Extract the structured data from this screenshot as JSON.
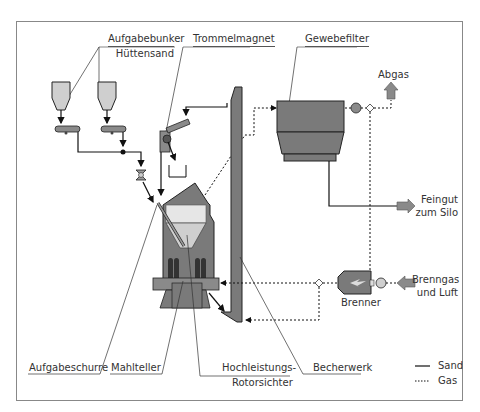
{
  "colors": {
    "frame": "#777777",
    "equipment_dark": "#7a7a7a",
    "equipment_light": "#cfcfcf",
    "equipment_lighter": "#e6e6e6",
    "line": "#111111",
    "arrow_fill": "#8a8a8a"
  },
  "labels": {
    "aufgabebunker": "Aufgabebunker",
    "huettensand": "Hüttensand",
    "trommelmagnet": "Trommelmagnet",
    "gewebefilter": "Gewebefilter",
    "abgas": "Abgas",
    "feingut_1": "Feingut",
    "feingut_2": "zum Silo",
    "brenngas_1": "Brenngas",
    "brenngas_2": "und Luft",
    "brenner": "Brenner",
    "aufgabeschurre": "Aufgabeschurre",
    "mahlteller": "Mahlteller",
    "rotorsichter_1": "Hochleistungs-",
    "rotorsichter_2": "Rotorsichter",
    "becherwerk": "Becherwerk"
  },
  "legend": {
    "items": [
      {
        "style": "solid",
        "label": "Sand"
      },
      {
        "style": "dotted",
        "label": "Gas"
      }
    ]
  },
  "feeder_icons": [
    "weigh-feeder-icon",
    "weigh-feeder-icon"
  ]
}
